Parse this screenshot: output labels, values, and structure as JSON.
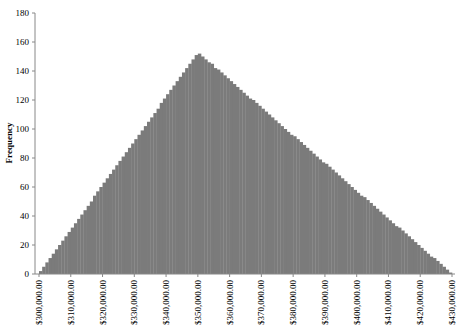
{
  "chart_data": {
    "type": "bar",
    "title": "",
    "xlabel": "",
    "ylabel": "Frequency",
    "ylim": [
      0,
      180
    ],
    "yticks": [
      0,
      20,
      40,
      60,
      80,
      100,
      120,
      140,
      160,
      180
    ],
    "xlim": [
      300000,
      430000
    ],
    "xticks": [
      300000,
      310000,
      320000,
      330000,
      340000,
      350000,
      360000,
      370000,
      380000,
      390000,
      400000,
      410000,
      420000,
      430000
    ],
    "xtick_labels": [
      "$300,000.00",
      "$310,000.00",
      "$320,000.00",
      "$330,000.00",
      "$340,000.00",
      "$350,000.00",
      "$360,000.00",
      "$370,000.00",
      "$380,000.00",
      "$390,000.00",
      "$400,000.00",
      "$410,000.00",
      "$420,000.00",
      "$430,000.00"
    ],
    "grid": false,
    "legend": null,
    "bin_start": 300000,
    "bin_width": 1000,
    "fill_color": "#7b7b7b",
    "values": [
      2,
      5,
      8,
      11,
      14,
      17,
      20,
      23,
      26,
      29,
      32,
      35,
      38,
      41,
      44,
      47,
      50,
      54,
      57,
      60,
      63,
      66,
      69,
      72,
      75,
      78,
      81,
      84,
      87,
      90,
      93,
      96,
      99,
      102,
      105,
      108,
      111,
      114,
      118,
      121,
      124,
      127,
      130,
      133,
      136,
      139,
      142,
      145,
      148,
      151,
      152,
      150,
      148,
      146,
      145,
      142,
      141,
      139,
      137,
      135,
      133,
      131,
      129,
      127,
      125,
      123,
      121,
      120,
      118,
      116,
      114,
      112,
      110,
      108,
      106,
      104,
      102,
      100,
      98,
      96,
      95,
      93,
      91,
      89,
      87,
      85,
      83,
      81,
      79,
      77,
      76,
      74,
      72,
      70,
      68,
      66,
      64,
      62,
      60,
      58,
      56,
      54,
      53,
      51,
      49,
      47,
      45,
      43,
      41,
      39,
      37,
      35,
      33,
      32,
      30,
      28,
      26,
      24,
      22,
      20,
      18,
      16,
      14,
      12,
      11,
      9,
      7,
      5,
      3,
      1
    ]
  },
  "layout": {
    "plot_left": 35,
    "plot_right": 455,
    "y_top_px": 13,
    "y_zero_px": 274,
    "x_first_tick_px": 39,
    "x_last_tick_px": 452
  }
}
